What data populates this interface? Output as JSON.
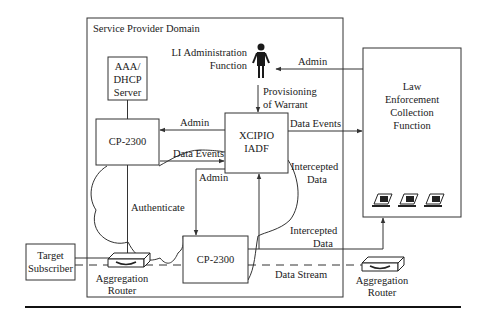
{
  "diagram": {
    "domain_title": "Service Provider Domain",
    "nodes": {
      "li_admin": {
        "line1": "LI Administration",
        "line2": "Function"
      },
      "aaa": {
        "line1": "AAA/",
        "line2": "DHCP",
        "line3": "Server"
      },
      "cp_top": {
        "label": "CP-2300"
      },
      "xcipio": {
        "line1": "XCIPIO",
        "line2": "IADF"
      },
      "cp_bottom": {
        "label": "CP-2300"
      },
      "lea": {
        "line1": "Law",
        "line2": "Enforcement",
        "line3": "Collection",
        "line4": "Function"
      },
      "target": {
        "line1": "Target",
        "line2": "Subscriber"
      },
      "router_left": {
        "line1": "Aggregation",
        "line2": "Router"
      },
      "router_right": {
        "line1": "Aggregation",
        "line2": "Router"
      }
    },
    "edges": {
      "admin_lea_to_li": "Admin",
      "provisioning_1": "Provisioning",
      "provisioning_2": "of Warrant",
      "admin_xcipio_to_cp": "Admin",
      "data_events_cp_to_xcipio": "Data Events",
      "data_events_xcipio_to_lea": "Data Events",
      "intercepted_1a": "Intercepted",
      "intercepted_1b": "Data",
      "admin_xcipio_to_cp_bottom": "Admin",
      "authenticate": "Authenticate",
      "intercepted_2a": "Intercepted",
      "intercepted_2b": "Data",
      "data_stream": "Data Stream"
    },
    "colors": {
      "stroke": "#333333",
      "text": "#1a1a1a",
      "background": "#ffffff"
    }
  }
}
